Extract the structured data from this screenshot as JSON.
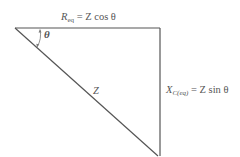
{
  "diagram": {
    "labels": {
      "top": {
        "main": "R",
        "sub": "eq",
        "rest": " = Z cos θ"
      },
      "right": {
        "main": "X",
        "sub": "C(eq)",
        "rest": " = Z sin θ"
      },
      "hypotenuse": "Z",
      "angle": "θ"
    },
    "colors": {
      "line": "#555555",
      "text": "#555555",
      "background": "#ffffff"
    }
  }
}
